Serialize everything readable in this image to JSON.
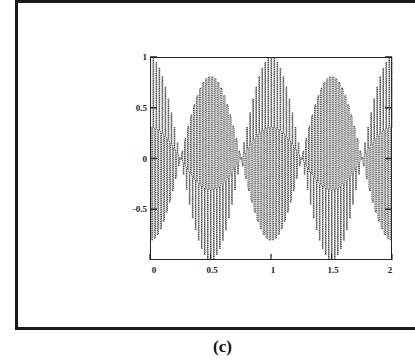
{
  "figure": {
    "caption": "(c)"
  },
  "chart_data": {
    "type": "line",
    "title": "",
    "xlabel": "",
    "ylabel": "",
    "xlim": [
      0,
      2
    ],
    "ylim": [
      -1,
      1
    ],
    "grid": false,
    "legend": null,
    "x_ticks": [
      "0",
      "0.5",
      "1",
      "1.5",
      "2"
    ],
    "x_tick_values": [
      0,
      0.5,
      1,
      1.5,
      2
    ],
    "y_ticks": [
      "1",
      "0.5",
      "0",
      "-0.5"
    ],
    "y_tick_values": [
      1,
      0.5,
      0,
      -0.5
    ],
    "series": [
      {
        "name": "sampled signal",
        "description": "High-frequency sampled oscillation drawn as dense vertical segments, with a beat envelope reaching ±1 near x = 0, 0.5, 1, 1.5, 2 and near-zero amplitude near x = 0.25, 0.75, 1.25, 1.75",
        "model": "y = cos(2*pi*1*x) * cos(2*pi*40*x)",
        "envelope_freq": 1,
        "carrier_freq": 40,
        "samples": 400,
        "color": "#333333"
      }
    ],
    "envelope_peaks_x": [
      0,
      0.5,
      1,
      1.5,
      2
    ],
    "envelope_nulls_x": [
      0.25,
      0.75,
      1.25,
      1.75
    ]
  }
}
